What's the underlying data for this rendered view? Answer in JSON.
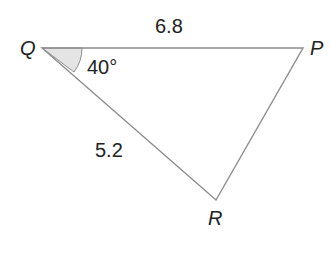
{
  "diagram": {
    "type": "triangle",
    "vertices": [
      {
        "name": "Q",
        "label": "Q"
      },
      {
        "name": "P",
        "label": "P"
      },
      {
        "name": "R",
        "label": "R"
      }
    ],
    "sides": [
      {
        "from": "Q",
        "to": "P",
        "label": "6.8"
      },
      {
        "from": "Q",
        "to": "R",
        "label": "5.2"
      }
    ],
    "angles": [
      {
        "vertex": "Q",
        "label": "40°",
        "shaded": true
      }
    ],
    "colors": {
      "line": "#8c8c8c",
      "angle_fill": "#e4e4e4",
      "text": "#222222"
    }
  }
}
